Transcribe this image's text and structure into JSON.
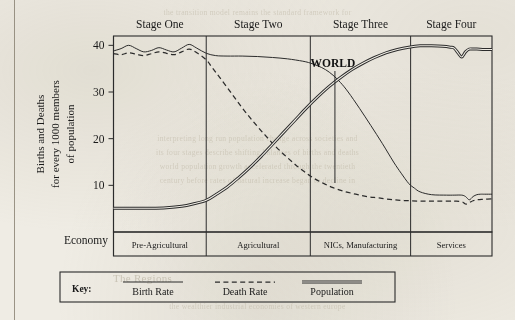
{
  "figure": {
    "economy_label": "Economy",
    "annotation": "WORLD",
    "y_axis_title_lines": [
      "Births and Deaths",
      "for every 1000 members",
      "of population"
    ]
  },
  "legend": {
    "key_label": "Key:",
    "entries": [
      {
        "label": "Birth Rate",
        "style": "solid"
      },
      {
        "label": "Death Rate",
        "style": "dashed"
      },
      {
        "label": "Population",
        "style": "double"
      }
    ]
  },
  "chart_data": {
    "type": "line",
    "title": "",
    "xlabel": "",
    "ylabel": "Births and Deaths for every 1000 members of population",
    "ylim": [
      0,
      42
    ],
    "xlim": [
      0,
      100
    ],
    "yticks": [
      10,
      20,
      30,
      40
    ],
    "grid": false,
    "legend_position": "bottom",
    "stages": [
      {
        "label": "Stage One",
        "economy": "Pre-Agricultural",
        "x_start": 0,
        "x_end": 24.5
      },
      {
        "label": "Stage Two",
        "economy": "Agricultural",
        "x_start": 24.5,
        "x_end": 52.0
      },
      {
        "label": "Stage Three",
        "economy": "NICs, Manufacturing",
        "x_start": 52.0,
        "x_end": 78.5
      },
      {
        "label": "Stage Four",
        "economy": "Services",
        "x_start": 78.5,
        "x_end": 100
      }
    ],
    "annotations": [
      {
        "text": "WORLD",
        "x": 58.5,
        "y_top": 34.5,
        "y_bottom": 10.5,
        "marker": "vertical-line"
      }
    ],
    "series": [
      {
        "name": "Birth Rate",
        "style": "solid",
        "x": [
          0,
          2,
          4,
          6,
          8,
          10,
          12,
          14,
          16,
          18,
          20,
          22,
          24.5,
          27,
          30,
          34,
          38,
          42,
          46,
          50,
          52,
          54,
          56,
          58,
          60,
          62,
          65,
          68,
          71,
          74,
          76,
          78,
          79.5,
          81,
          84,
          88,
          90,
          92,
          93,
          94,
          95,
          96,
          97,
          98,
          100
        ],
        "y": [
          38.8,
          39.3,
          40.0,
          39.3,
          38.6,
          38.9,
          39.5,
          39.0,
          38.6,
          39.4,
          40.2,
          39.4,
          38.3,
          37.8,
          37.7,
          37.7,
          37.6,
          37.4,
          37.1,
          36.6,
          36.2,
          35.6,
          34.8,
          33.6,
          32.0,
          30.0,
          26.5,
          22.8,
          19.0,
          15.0,
          12.6,
          10.4,
          9.4,
          8.6,
          8.0,
          7.9,
          7.9,
          7.9,
          7.6,
          6.9,
          7.6,
          8.0,
          8.1,
          8.1,
          8.1
        ]
      },
      {
        "name": "Death Rate",
        "style": "dashed",
        "x": [
          0,
          2,
          4,
          6,
          8,
          10,
          12,
          14,
          16,
          18,
          20,
          22,
          24.5,
          26,
          28,
          31,
          34,
          37,
          40,
          43,
          46,
          49,
          52,
          55,
          58,
          61,
          64,
          67,
          70,
          74,
          78,
          82,
          86,
          90,
          92,
          93,
          94,
          95,
          96,
          98,
          100
        ],
        "y": [
          38.2,
          38.0,
          38.4,
          38.1,
          37.8,
          38.2,
          38.6,
          38.3,
          38.0,
          38.6,
          39.2,
          38.4,
          36.9,
          35.3,
          33.2,
          29.9,
          26.6,
          23.6,
          20.8,
          18.2,
          15.9,
          13.8,
          12.0,
          10.6,
          9.5,
          8.7,
          8.1,
          7.6,
          7.3,
          6.9,
          6.7,
          6.6,
          6.6,
          6.6,
          6.5,
          6.0,
          6.3,
          6.7,
          6.9,
          7.0,
          7.1
        ]
      },
      {
        "name": "Population",
        "style": "double",
        "x": [
          0,
          5,
          10,
          14,
          18,
          21,
          24.5,
          27,
          30,
          33,
          36,
          39,
          42,
          45,
          48,
          51,
          54,
          57,
          60,
          63,
          66,
          69,
          72,
          75,
          78,
          81,
          84,
          87,
          89,
          90,
          91,
          92,
          93,
          94,
          95,
          96,
          98,
          100
        ],
        "y": [
          5.1,
          5.1,
          5.1,
          5.2,
          5.5,
          6.0,
          6.8,
          8.0,
          9.6,
          11.6,
          13.8,
          16.2,
          18.8,
          21.4,
          24.0,
          26.6,
          29.0,
          31.2,
          33.1,
          34.8,
          36.2,
          37.4,
          38.4,
          39.1,
          39.6,
          39.9,
          39.9,
          39.8,
          39.6,
          39.4,
          38.4,
          37.5,
          38.6,
          39.2,
          39.2,
          39.2,
          39.1,
          39.1
        ]
      }
    ]
  },
  "bleed_text": {
    "lines": [
      "the transition model remains the standard framework for",
      "interpreting long run population change across societies and",
      "its four stages describe shifting balances of births and deaths",
      "world population growth accelerated through the twentieth",
      "century before rates of natural increase began to decline in",
      "the wealthier industrial economies of western europe",
      "The Regions"
    ]
  }
}
